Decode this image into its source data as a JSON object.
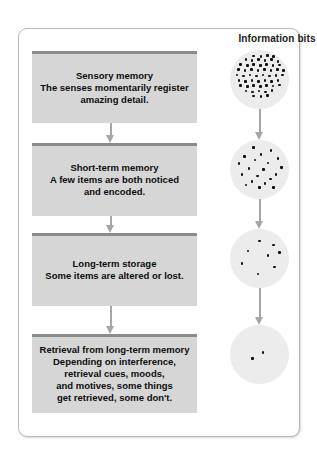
{
  "figure": {
    "type": "memory-stage-flow-diagram",
    "right_column_title": "Information bits",
    "box_fill_color": "#d6d6d6",
    "box_bar_color": "#8b8b8b",
    "arrow_color": "#a6a6a6",
    "circle_fill_color": "#ececec",
    "dot_color": "#111111",
    "frame_border_color": "#b9b9b9"
  },
  "stages": [
    {
      "title": "Sensory memory",
      "description": "The senses momentarily register amazing detail.",
      "lines": [
        "The senses momentarily register",
        "amazing detail."
      ],
      "bits_count": 55
    },
    {
      "title": "Short-term memory",
      "description": "A few items are both noticed and encoded.",
      "lines": [
        "A few items are both noticed",
        "and encoded."
      ],
      "bits_count": 20
    },
    {
      "title": "Long-term storage",
      "description": "Some items are altered or lost.",
      "lines": [
        "Some items are altered or lost."
      ],
      "bits_count": 7
    },
    {
      "title": "Retrieval from long-term memory",
      "description": "Depending on interference, retrieval cues, moods, and motives, some things get retrieved, some don't.",
      "lines": [
        "Depending on interference,",
        "retrieval cues, moods,",
        "and motives, some things",
        "get retrieved, some don't."
      ],
      "bits_count": 2
    }
  ],
  "bit_dots": {
    "circle_0": [
      [
        38,
        8
      ],
      [
        50,
        9
      ],
      [
        61,
        7
      ],
      [
        72,
        9
      ],
      [
        25,
        14
      ],
      [
        35,
        16
      ],
      [
        46,
        14
      ],
      [
        57,
        16
      ],
      [
        68,
        14
      ],
      [
        79,
        17
      ],
      [
        16,
        22
      ],
      [
        27,
        24
      ],
      [
        38,
        22
      ],
      [
        49,
        24
      ],
      [
        60,
        22
      ],
      [
        71,
        24
      ],
      [
        82,
        23
      ],
      [
        12,
        31
      ],
      [
        23,
        33
      ],
      [
        34,
        31
      ],
      [
        45,
        33
      ],
      [
        56,
        31
      ],
      [
        67,
        33
      ],
      [
        78,
        31
      ],
      [
        88,
        33
      ],
      [
        10,
        40
      ],
      [
        21,
        42
      ],
      [
        32,
        40
      ],
      [
        43,
        42
      ],
      [
        54,
        40
      ],
      [
        65,
        42
      ],
      [
        76,
        41
      ],
      [
        87,
        40
      ],
      [
        13,
        49
      ],
      [
        24,
        51
      ],
      [
        35,
        49
      ],
      [
        46,
        51
      ],
      [
        57,
        49
      ],
      [
        68,
        51
      ],
      [
        79,
        49
      ],
      [
        16,
        58
      ],
      [
        27,
        60
      ],
      [
        38,
        58
      ],
      [
        49,
        60
      ],
      [
        60,
        58
      ],
      [
        71,
        59
      ],
      [
        82,
        57
      ],
      [
        25,
        67
      ],
      [
        36,
        69
      ],
      [
        47,
        67
      ],
      [
        58,
        69
      ],
      [
        69,
        66
      ],
      [
        38,
        76
      ],
      [
        50,
        77
      ],
      [
        61,
        75
      ]
    ],
    "circle_1": [
      [
        38,
        11
      ],
      [
        67,
        16
      ],
      [
        22,
        26
      ],
      [
        50,
        22
      ],
      [
        79,
        29
      ],
      [
        13,
        38
      ],
      [
        40,
        32
      ],
      [
        62,
        37
      ],
      [
        85,
        44
      ],
      [
        30,
        46
      ],
      [
        55,
        48
      ],
      [
        76,
        56
      ],
      [
        18,
        56
      ],
      [
        44,
        59
      ],
      [
        66,
        64
      ],
      [
        35,
        68
      ],
      [
        57,
        72
      ],
      [
        25,
        74
      ],
      [
        48,
        78
      ],
      [
        72,
        78
      ]
    ],
    "circle_2": [
      [
        48,
        18
      ],
      [
        72,
        25
      ],
      [
        28,
        35
      ],
      [
        62,
        43
      ],
      [
        82,
        38
      ],
      [
        18,
        56
      ],
      [
        45,
        74
      ],
      [
        73,
        62
      ]
    ],
    "circle_3": [
      [
        36,
        55
      ],
      [
        54,
        44
      ]
    ]
  }
}
